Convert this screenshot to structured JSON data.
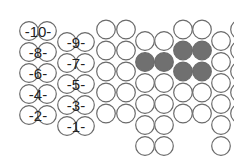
{
  "diagram": {
    "type": "circle-packing-grid",
    "colors": {
      "outline": "#6a6a6a",
      "empty_fill": "#ffffff",
      "filled": "#707070",
      "label_text": "#222222"
    },
    "labels": {
      "left_column": [
        "-10-",
        "-8-",
        "-6-",
        "-4-",
        "-2-"
      ],
      "right_column": [
        "-9-",
        "-7-",
        "-5-",
        "-3-",
        "-1-"
      ]
    },
    "grid": {
      "columns": [
        {
          "name": "col-a",
          "x": 106,
          "offset": "high",
          "count": 5,
          "filled_rows": []
        },
        {
          "name": "col-b",
          "x": 126,
          "offset": "high",
          "count": 5,
          "filled_rows": []
        },
        {
          "name": "col-c",
          "x": 145,
          "offset": "low",
          "count": 6,
          "filled_rows": [
            1
          ]
        },
        {
          "name": "col-d",
          "x": 164,
          "offset": "low",
          "count": 6,
          "filled_rows": [
            1
          ]
        },
        {
          "name": "col-e",
          "x": 183,
          "offset": "high",
          "count": 5,
          "filled_rows": [
            1,
            2
          ]
        },
        {
          "name": "col-f",
          "x": 202,
          "offset": "high",
          "count": 5,
          "filled_rows": [
            1,
            2
          ]
        },
        {
          "name": "col-g",
          "x": 221,
          "offset": "low",
          "count": 6,
          "filled_rows": []
        },
        {
          "name": "col-h",
          "x": 240,
          "offset": "high",
          "count": 5,
          "filled_rows": []
        }
      ]
    }
  }
}
